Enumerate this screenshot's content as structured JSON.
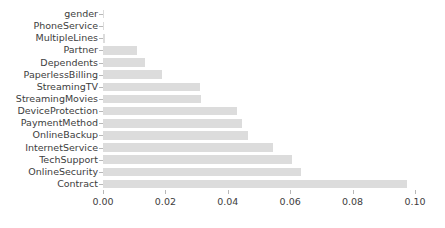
{
  "chart_data": {
    "type": "bar",
    "orientation": "horizontal",
    "title": "",
    "xlabel": "",
    "ylabel": "",
    "xlim": [
      0.0,
      0.1
    ],
    "xticks": [
      0.0,
      0.02,
      0.04,
      0.06,
      0.08,
      0.1
    ],
    "xtick_labels": [
      "0.00",
      "0.02",
      "0.04",
      "0.06",
      "0.08",
      "0.10"
    ],
    "grid": false,
    "legend": null,
    "bar_color": "#dcdcdc",
    "categories": [
      "gender",
      "PhoneService",
      "MultipleLines",
      "Partner",
      "Dependents",
      "PaperlessBilling",
      "StreamingTV",
      "StreamingMovies",
      "DeviceProtection",
      "PaymentMethod",
      "OnlineBackup",
      "InternetService",
      "TechSupport",
      "OnlineSecurity",
      "Contract"
    ],
    "values": [
      0.0001,
      0.0003,
      0.0007,
      0.011,
      0.0135,
      0.019,
      0.031,
      0.0315,
      0.043,
      0.0445,
      0.0465,
      0.0545,
      0.0605,
      0.0635,
      0.0975
    ]
  }
}
